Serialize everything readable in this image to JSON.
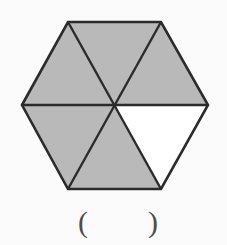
{
  "figure": {
    "name": "regular-hexagon-divided-into-six-triangles",
    "shape": "hexagon",
    "sides": 6,
    "partition": "three main diagonals through center creating six congruent equilateral triangles",
    "total_parts": 6,
    "shaded_parts": 5,
    "unshaded_parts": 1,
    "shaded_fraction": "5/6",
    "unshaded_fraction": "1/6",
    "unshaded_region": "bottom-right",
    "shaded_regions": [
      "top-left",
      "top-right",
      "left",
      "bottom-left",
      "bottom-center"
    ],
    "colors": {
      "shaded_fill": "#b9b9b9",
      "unshaded_fill": "#ffffff",
      "stroke": "#2b2b2b",
      "background": "#fbfbfb"
    },
    "stroke_width": 2.4,
    "geometry": {
      "center_x": 115,
      "center_y": 105,
      "radius_x": 93,
      "radius_y": 84,
      "vertices": [
        {
          "label": "left",
          "x": 22,
          "y": 105
        },
        {
          "label": "top-left",
          "x": 68,
          "y": 22
        },
        {
          "label": "top-right",
          "x": 161,
          "y": 22
        },
        {
          "label": "right",
          "x": 208,
          "y": 105
        },
        {
          "label": "bottom-right",
          "x": 161,
          "y": 189
        },
        {
          "label": "bottom-left",
          "x": 68,
          "y": 189
        }
      ]
    }
  },
  "answer": {
    "open_paren": "(",
    "close_paren": ")",
    "value": "",
    "placeholder": ""
  }
}
